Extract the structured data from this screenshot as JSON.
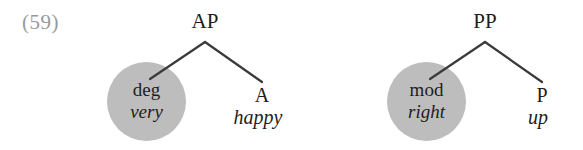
{
  "figure": {
    "example_number": "(59)",
    "background_color": "#ffffff",
    "node_circle_color": "#bdbdbd",
    "branch_color": "#3a3a3a",
    "number_color": "#9a9a9a"
  },
  "trees": [
    {
      "id": "ap",
      "root_label": "AP",
      "left_child": {
        "category": "deg",
        "word": "very",
        "circled": true
      },
      "right_child": {
        "category": "A",
        "word": "happy",
        "circled": false
      }
    },
    {
      "id": "pp",
      "root_label": "PP",
      "left_child": {
        "category": "mod",
        "word": "right",
        "circled": true
      },
      "right_child": {
        "category": "P",
        "word": "up",
        "circled": false
      }
    }
  ]
}
